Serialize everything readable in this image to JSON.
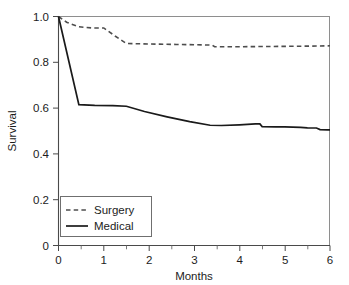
{
  "chart_data": {
    "type": "line",
    "title": "",
    "subtitle": "",
    "xlabel": "Months",
    "ylabel": "Survival",
    "xlim": [
      0,
      6
    ],
    "ylim": [
      0,
      1.0
    ],
    "grid": false,
    "legend_position": "bottom-left",
    "xticks": [
      0,
      1,
      2,
      3,
      4,
      5,
      6
    ],
    "xtick_labels": [
      "0",
      "1",
      "2",
      "3",
      "4",
      "5",
      "6"
    ],
    "xminor_ticks": [
      0.5,
      1.5,
      2.5,
      3.5,
      4.5,
      5.5
    ],
    "yticks": [
      0,
      0.2,
      0.4,
      0.6,
      0.8,
      1.0
    ],
    "ytick_labels": [
      "0",
      "0.2",
      "0.4",
      "0.6",
      "0.8",
      "1.0"
    ],
    "series": [
      {
        "name": "Surgery",
        "style": "dashed",
        "color": "#4d4d4d",
        "x": [
          0,
          0.18,
          0.45,
          0.75,
          1.0,
          1.25,
          1.5,
          2.0,
          2.6,
          3.2,
          3.4,
          3.45,
          4.0,
          4.6,
          5.2,
          5.7,
          6.0
        ],
        "y": [
          1.0,
          0.975,
          0.955,
          0.95,
          0.95,
          0.915,
          0.882,
          0.88,
          0.878,
          0.876,
          0.875,
          0.868,
          0.868,
          0.869,
          0.87,
          0.871,
          0.872
        ]
      },
      {
        "name": "Medical",
        "style": "solid",
        "color": "#1a1a1a",
        "x": [
          0,
          0.45,
          0.8,
          1.2,
          1.5,
          1.9,
          2.4,
          2.9,
          3.35,
          3.6,
          4.0,
          4.35,
          4.45,
          4.5,
          4.8,
          5.0,
          5.35,
          5.5,
          5.7,
          5.78,
          5.95,
          6.0
        ],
        "y": [
          1.0,
          0.615,
          0.612,
          0.611,
          0.608,
          0.585,
          0.562,
          0.541,
          0.525,
          0.524,
          0.527,
          0.531,
          0.531,
          0.519,
          0.518,
          0.518,
          0.516,
          0.514,
          0.513,
          0.506,
          0.505,
          0.505
        ]
      }
    ],
    "legend_entries": [
      {
        "label": "Surgery",
        "style": "dashed"
      },
      {
        "label": "Medical",
        "style": "solid"
      }
    ]
  }
}
